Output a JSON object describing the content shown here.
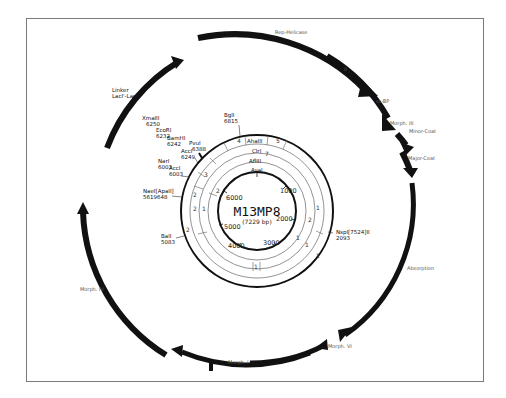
{
  "plasmid": {
    "name": "M13MP8",
    "size_label": "(7229 bp)"
  },
  "scale_ticks": [
    {
      "label": "1000",
      "x": 280,
      "y": 193
    },
    {
      "label": "2000",
      "x": 284,
      "y": 221
    },
    {
      "label": "3000",
      "x": 268,
      "y": 245
    },
    {
      "label": "4000",
      "x": 231,
      "y": 247
    },
    {
      "label": "5000",
      "x": 224,
      "y": 229
    },
    {
      "label": "6000",
      "x": 226,
      "y": 200
    }
  ],
  "enzyme_rings": [
    {
      "name": "AhaIII",
      "x": 250,
      "y": 143
    },
    {
      "name": "ClrI",
      "x": 252,
      "y": 153
    },
    {
      "name": "AflIII",
      "x": 249,
      "y": 162
    },
    {
      "name": "AvaI",
      "x": 252,
      "y": 172
    }
  ],
  "ring_numbers": [
    {
      "label": "4",
      "x": 237,
      "y": 143
    },
    {
      "label": "5",
      "x": 277,
      "y": 143
    },
    {
      "label": "7",
      "x": 264,
      "y": 156
    },
    {
      "label": "3",
      "x": 204,
      "y": 177
    },
    {
      "label": "2",
      "x": 193,
      "y": 195
    },
    {
      "label": "2",
      "x": 216,
      "y": 194
    },
    {
      "label": "2",
      "x": 193,
      "y": 210
    },
    {
      "label": "1",
      "x": 202,
      "y": 210
    },
    {
      "label": "2",
      "x": 308,
      "y": 222
    },
    {
      "label": "1",
      "x": 316,
      "y": 209
    },
    {
      "label": "1",
      "x": 296,
      "y": 240
    },
    {
      "label": "1",
      "x": 315,
      "y": 260
    },
    {
      "label": "1",
      "x": 304,
      "y": 246
    },
    {
      "label": "2",
      "x": 186,
      "y": 232
    },
    {
      "label": "1",
      "x": 251,
      "y": 268
    }
  ],
  "sites": [
    {
      "name": "BglI",
      "pos": "6815",
      "x": 225,
      "y": 118
    },
    {
      "name": "PvuI",
      "pos": "6388",
      "x": 189,
      "y": 146
    },
    {
      "name": "AccI",
      "pos": "6249",
      "x": 181,
      "y": 153
    },
    {
      "name": "BamHI",
      "pos": "6242",
      "x": 167,
      "y": 141
    },
    {
      "name": "EcoRI",
      "pos": "6232",
      "x": 155,
      "y": 133
    },
    {
      "name": "XmaIII",
      "pos": "6250",
      "x": 146,
      "y": 122
    },
    {
      "name": "NarI",
      "pos": "6003",
      "x": 158,
      "y": 164
    },
    {
      "name": "AccI",
      "pos": "6003",
      "x": 170,
      "y": 171
    },
    {
      "name": "NaeI[ApaII]",
      "pos": "5619648",
      "x": 143,
      "y": 193
    },
    {
      "name": "BalI",
      "pos": "5083",
      "x": 161,
      "y": 238
    },
    {
      "name": "NspI[7524]II",
      "pos": "2093",
      "x": 338,
      "y": 234
    },
    {
      "name": "Linker",
      "pos": "",
      "x": 113,
      "y": 92
    },
    {
      "name": "LacI'-LacZ'",
      "pos": "",
      "x": 113,
      "y": 98
    }
  ],
  "genes": [
    {
      "name": "Rep-Helicase",
      "x": 276,
      "y": 33
    },
    {
      "name": "II",
      "x": 345,
      "y": 70
    },
    {
      "name": "ss-BP",
      "x": 377,
      "y": 102
    },
    {
      "name": "Morph. III",
      "x": 392,
      "y": 124
    },
    {
      "name": "Minor-Coat",
      "x": 410,
      "y": 132
    },
    {
      "name": "Major-Coat",
      "x": 408,
      "y": 159
    },
    {
      "name": "Absorption",
      "x": 405,
      "y": 269
    },
    {
      "name": "Morph. VI",
      "x": 330,
      "y": 347
    },
    {
      "name": "Morph. I",
      "x": 228,
      "y": 363
    },
    {
      "name": "Morph. IV",
      "x": 81,
      "y": 290
    }
  ],
  "colors": {
    "ink": "#111111",
    "thin_ring": "#6a6a6a",
    "frame": "#7a7a7a"
  }
}
